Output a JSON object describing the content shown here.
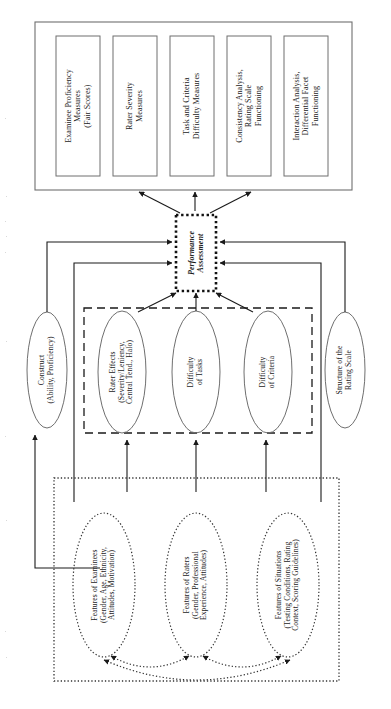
{
  "figure": {
    "orientation": "rotated-90-ccw",
    "colors": {
      "line": "#1a1a1a",
      "background": "#ffffff",
      "text": "#1a1a1a"
    }
  },
  "outcomes_box": {
    "name": "measurement-outcomes-container",
    "items": [
      {
        "id": "examinee-proficiency",
        "label": "Examinee Proficiency\nMeasures\n(Fair Scores)"
      },
      {
        "id": "rater-severity",
        "label": "Rater Severity\nMeasures"
      },
      {
        "id": "task-criteria-difficulty",
        "label": "Task and Criteria\nDifficulty Measures"
      },
      {
        "id": "consistency-analysis",
        "label": "Consistency Analysis,\nRating Scale\nFunctioning"
      },
      {
        "id": "interaction-analysis",
        "label": "Interaction Analysis,\nDifferential Facet\nFunctioning"
      }
    ]
  },
  "center": {
    "id": "performance-assessment",
    "label": "Performance\nAssessment",
    "border_style": "dotted"
  },
  "facets": {
    "construct": {
      "id": "construct",
      "label": "Construct\n(Ability, Proficiency)"
    },
    "rating_scale": {
      "id": "rating-scale-structure",
      "label": "Structure of the\nRating Scale"
    },
    "dashed_group": {
      "name": "facet-group-dashed",
      "border_style": "dashed",
      "items": [
        {
          "id": "rater-effects",
          "label": "Rater Effects\n(Severity/Leniency,\nCentral Tend., Halo)"
        },
        {
          "id": "difficulty-of-tasks",
          "label": "Difficulty\nof Tasks"
        },
        {
          "id": "difficulty-of-criteria",
          "label": "Difficulty\nof Criteria"
        }
      ]
    }
  },
  "features_box": {
    "name": "background-features-container",
    "border_style": "dotted",
    "items": [
      {
        "id": "features-of-examinees",
        "label": "Features of Examinees\n(Gender, Age, Ethnicity,\nAttitudes, Motivation)"
      },
      {
        "id": "features-of-raters",
        "label": "Features of Raters\n(Gender, Professional\nExperience, Attitudes)"
      },
      {
        "id": "features-of-situations",
        "label": "Features of Situations\n(Testing Conditions, Rating\nContext, Scoring Guidelines)"
      }
    ]
  }
}
